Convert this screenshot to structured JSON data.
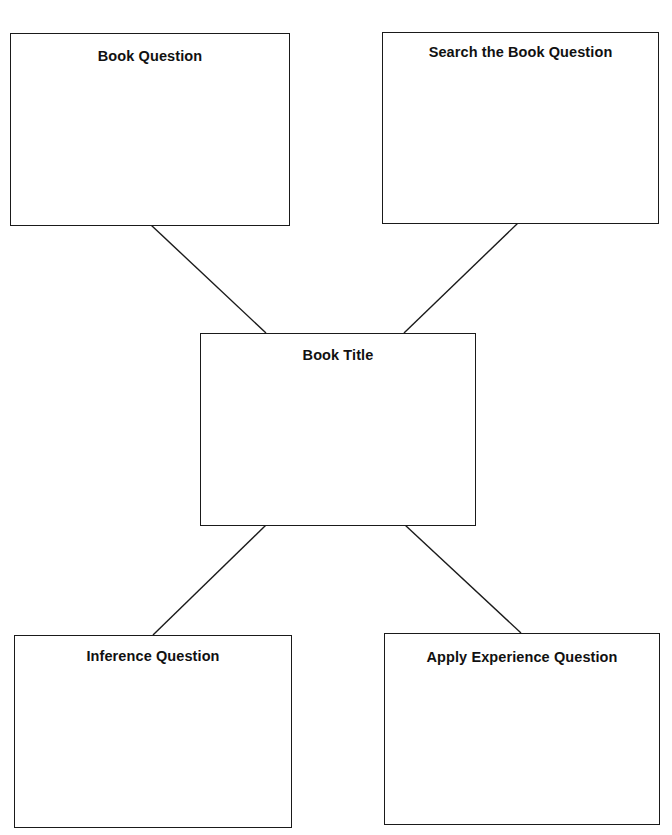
{
  "diagram": {
    "type": "graphic-organizer",
    "line_color": "#1a1a1a",
    "nodes": [
      {
        "id": "book-question",
        "label": "Book Question"
      },
      {
        "id": "search-book-question",
        "label": "Search the Book Question"
      },
      {
        "id": "book-title",
        "label": "Book Title"
      },
      {
        "id": "inference-question",
        "label": "Inference Question"
      },
      {
        "id": "apply-experience-question",
        "label": "Apply Experience Question"
      }
    ],
    "edges": [
      {
        "from": "book-question",
        "to": "book-title"
      },
      {
        "from": "search-book-question",
        "to": "book-title"
      },
      {
        "from": "book-title",
        "to": "inference-question"
      },
      {
        "from": "book-title",
        "to": "apply-experience-question"
      }
    ]
  }
}
